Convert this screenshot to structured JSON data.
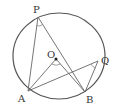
{
  "diagram": {
    "type": "geometry-circle-inscribed-angles",
    "circle": {
      "center_label": "O",
      "cx": 59,
      "cy": 56,
      "rx": 46,
      "ry": 43
    },
    "points": {
      "P": {
        "label": "P",
        "x": 38,
        "y": 17
      },
      "Q": {
        "label": "Q",
        "x": 98,
        "y": 61
      },
      "A": {
        "label": "A",
        "x": 28,
        "y": 91
      },
      "B": {
        "label": "B",
        "x": 85,
        "y": 92
      },
      "O": {
        "label": "O",
        "x": 56,
        "y": 59
      }
    },
    "segments": [
      "PA",
      "PB",
      "QA",
      "QB",
      "OA",
      "OB"
    ],
    "angle_marks": [
      "angle APB",
      "angle AQB",
      "angle AOB"
    ],
    "colors": {
      "stroke": "#555555",
      "background": "#ffffff"
    }
  }
}
